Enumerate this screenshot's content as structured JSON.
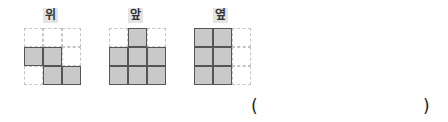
{
  "views": [
    {
      "label": "위",
      "cells": [
        [
          0,
          0,
          0
        ],
        [
          1,
          1,
          0
        ],
        [
          0,
          1,
          1
        ]
      ]
    },
    {
      "label": "앞",
      "cells": [
        [
          0,
          1,
          0
        ],
        [
          1,
          1,
          1
        ],
        [
          1,
          1,
          1
        ]
      ]
    },
    {
      "label": "옆",
      "cells": [
        [
          1,
          1,
          0
        ],
        [
          1,
          1,
          0
        ],
        [
          1,
          1,
          0
        ]
      ]
    }
  ],
  "answer": {
    "open_paren": "(",
    "close_paren": ")",
    "value": ""
  },
  "colors": {
    "filled": "#c9c9c9",
    "filled_border": "#555555",
    "dashed_border": "#c4c4c4",
    "label_bg": "#e4e4e4"
  }
}
